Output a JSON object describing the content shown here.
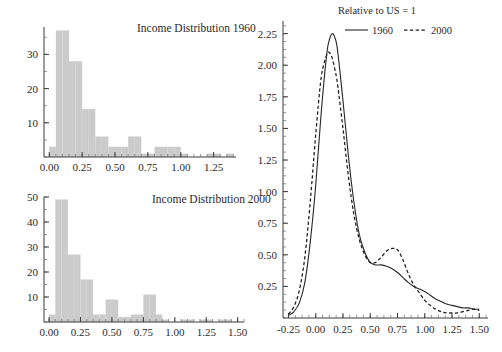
{
  "figure": {
    "background": "#ffffff",
    "bar_color": "#cbcbcb",
    "line_color": "#262626"
  },
  "panels": {
    "top_left": {
      "title": "Income Distribution 1960"
    },
    "bottom_left": {
      "title": "Income Distribution 2000"
    },
    "right": {
      "note": "Relative to US = 1",
      "legend": [
        {
          "label": "1960",
          "style": "solid"
        },
        {
          "label": "2000",
          "style": "dashed"
        }
      ]
    }
  },
  "chart_data": [
    {
      "type": "bar",
      "id": "income-distribution-1960",
      "title": "Income Distribution 1960",
      "xlabel": "",
      "ylabel": "",
      "xlim": [
        -0.04,
        1.42
      ],
      "ylim": [
        0,
        38
      ],
      "grid": false,
      "xticks": [
        0.0,
        0.25,
        0.5,
        0.75,
        1.0,
        1.25
      ],
      "xtick_labels": [
        "0.00",
        "0.25",
        "0.50",
        "0.75",
        "1.00",
        "1.25"
      ],
      "yticks": [
        10,
        20,
        30
      ],
      "ytick_labels": [
        "10",
        "20",
        "30"
      ],
      "bin_width": 0.05,
      "bin_starts": [
        0.0,
        0.05,
        0.1,
        0.15,
        0.2,
        0.25,
        0.3,
        0.35,
        0.4,
        0.45,
        0.5,
        0.55,
        0.6,
        0.65,
        0.7,
        0.75,
        0.8,
        0.85,
        0.9,
        0.95,
        1.0,
        1.05,
        1.1,
        1.15,
        1.2,
        1.25,
        1.3,
        1.35
      ],
      "values": [
        3,
        37,
        37,
        28,
        28,
        14,
        14,
        6,
        6,
        3,
        3,
        3,
        6,
        6,
        1,
        1,
        3,
        3,
        3,
        3,
        1,
        0,
        0,
        0,
        1,
        1,
        0,
        1
      ]
    },
    {
      "type": "bar",
      "id": "income-distribution-2000",
      "title": "Income Distribution 2000",
      "xlabel": "",
      "ylabel": "",
      "xlim": [
        -0.04,
        1.55
      ],
      "ylim": [
        0,
        50
      ],
      "grid": false,
      "xticks": [
        0.0,
        0.25,
        0.5,
        0.75,
        1.0,
        1.25,
        1.5
      ],
      "xtick_labels": [
        "0.00",
        "0.25",
        "0.50",
        "0.75",
        "1.00",
        "1.25",
        "1.50"
      ],
      "yticks": [
        10,
        20,
        30,
        40,
        50
      ],
      "ytick_labels": [
        "10",
        "20",
        "30",
        "40",
        "50"
      ],
      "bin_width": 0.05,
      "bin_starts": [
        0.0,
        0.05,
        0.1,
        0.15,
        0.2,
        0.25,
        0.3,
        0.35,
        0.4,
        0.45,
        0.5,
        0.55,
        0.6,
        0.65,
        0.7,
        0.75,
        0.8,
        0.85,
        0.9,
        0.95,
        1.0,
        1.05,
        1.1,
        1.15,
        1.2,
        1.25,
        1.3,
        1.35,
        1.4,
        1.45
      ],
      "values": [
        3,
        49,
        49,
        27,
        27,
        17,
        17,
        3,
        3,
        9,
        9,
        2,
        2,
        3,
        3,
        11,
        11,
        3,
        1,
        0,
        0,
        1,
        1,
        0,
        1,
        1,
        0,
        1,
        1,
        0
      ]
    },
    {
      "type": "line",
      "id": "relative-income-density",
      "title": "Relative to US = 1",
      "xlabel": "",
      "ylabel": "",
      "xlim": [
        -0.3,
        1.58
      ],
      "ylim": [
        0,
        2.35
      ],
      "grid": false,
      "xticks": [
        -0.25,
        0.0,
        0.25,
        0.5,
        0.75,
        1.0,
        1.25,
        1.5
      ],
      "xtick_labels": [
        "-0.25",
        "0.00",
        "0.25",
        "0.50",
        "0.75",
        "1.00",
        "1.25",
        "1.50"
      ],
      "yticks": [
        0.25,
        0.5,
        0.75,
        1.0,
        1.25,
        1.5,
        1.75,
        2.0,
        2.25
      ],
      "ytick_labels": [
        "0.25",
        "0.50",
        "0.75",
        "1.00",
        "1.25",
        "1.50",
        "1.75",
        "2.00",
        "2.25"
      ],
      "legend_position": "top-right",
      "x": [
        -0.25,
        -0.2,
        -0.15,
        -0.1,
        -0.05,
        0.0,
        0.05,
        0.1,
        0.125,
        0.15,
        0.175,
        0.2,
        0.25,
        0.3,
        0.35,
        0.4,
        0.45,
        0.5,
        0.55,
        0.6,
        0.65,
        0.7,
        0.75,
        0.8,
        0.85,
        0.9,
        0.95,
        1.0,
        1.05,
        1.1,
        1.15,
        1.2,
        1.25,
        1.3,
        1.35,
        1.4,
        1.45,
        1.5
      ],
      "series": [
        {
          "name": "1960",
          "style": "solid",
          "values": [
            0.02,
            0.05,
            0.12,
            0.28,
            0.6,
            1.05,
            1.62,
            2.08,
            2.2,
            2.25,
            2.22,
            2.12,
            1.72,
            1.28,
            0.92,
            0.66,
            0.52,
            0.44,
            0.42,
            0.42,
            0.41,
            0.39,
            0.36,
            0.32,
            0.28,
            0.25,
            0.23,
            0.21,
            0.18,
            0.15,
            0.13,
            0.11,
            0.1,
            0.09,
            0.08,
            0.08,
            0.07,
            0.07
          ]
        },
        {
          "name": "2000",
          "style": "dashed",
          "values": [
            0.03,
            0.09,
            0.22,
            0.48,
            0.92,
            1.45,
            1.9,
            2.08,
            2.1,
            2.06,
            1.97,
            1.85,
            1.5,
            1.12,
            0.82,
            0.62,
            0.5,
            0.44,
            0.44,
            0.48,
            0.53,
            0.55,
            0.54,
            0.46,
            0.35,
            0.26,
            0.2,
            0.14,
            0.1,
            0.07,
            0.05,
            0.04,
            0.04,
            0.04,
            0.05,
            0.06,
            0.07,
            0.06
          ]
        }
      ]
    }
  ]
}
